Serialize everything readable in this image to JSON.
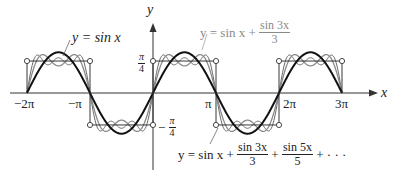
{
  "chart_data": {
    "type": "line",
    "title": "",
    "xlabel": "x",
    "ylabel": "y",
    "x_ticks": [
      "-2π",
      "-π",
      "π",
      "2π",
      "3π"
    ],
    "y_ticks": [
      "π/4",
      "-π/4"
    ],
    "xlim": [
      -6.7,
      10.2
    ],
    "ylim": [
      -1.6,
      2.2
    ],
    "grid": false,
    "legend_position": "inline annotations",
    "series": [
      {
        "name": "y = sin x",
        "expression": "sin x",
        "color": "#111111",
        "style": "thick solid"
      },
      {
        "name": "y = sin x + sin 3x / 3",
        "expression": "sin x + sin(3x)/3",
        "color": "#8a8a8a",
        "style": "gray solid"
      },
      {
        "name": "y = sin x + sin 3x / 3 + sin 5x / 5 + ...",
        "expression": "square wave of amplitude π/4 (partial sum with 3 terms shown)",
        "color": "#555555",
        "style": "thin solid"
      },
      {
        "name": "square wave",
        "expression": "π/4 on (0,π), -π/4 on (π,2π), period 2π",
        "color": "#222222",
        "style": "thin solid with open circles at jumps",
        "values": {
          "high": 0.785,
          "low": -0.785
        }
      }
    ],
    "annotations": [
      {
        "text": "y = sin x",
        "points_to": "sin x curve near x=-3π/2"
      },
      {
        "text": "y = sin x + sin 3x / 3",
        "points_to": "gray curve near x=3π/2"
      },
      {
        "text": "y = sin x + sin 3x / 3 + sin 5x / 5 + ···",
        "points_to": "thin curve near x=π"
      }
    ]
  },
  "labels": {
    "y_axis": "y",
    "x_axis": "x",
    "tick_neg2pi": "−2π",
    "tick_negpi": "−π",
    "tick_pi": "π",
    "tick_2pi": "2π",
    "tick_3pi": "3π",
    "pi_over_4_num": "π",
    "pi_over_4_den": "4",
    "neg_sign": "−",
    "sinx": "y = sin x",
    "eq2_prefix": "y = sin x +",
    "eq2_num": "sin 3x",
    "eq2_den": "3",
    "eq3_prefix": "y = sin x +",
    "eq3_num1": "sin 3x",
    "eq3_den1": "3",
    "eq3_plus": "+",
    "eq3_num2": "sin 5x",
    "eq3_den2": "5",
    "eq3_tail": "+ · · ·"
  }
}
